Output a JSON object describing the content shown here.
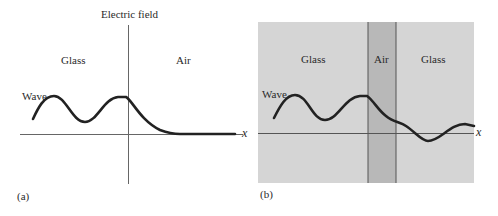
{
  "panel_a": {
    "caption": "(a)",
    "axis_label_y": "Electric field",
    "axis_label_x": "x",
    "region_left": "Glass",
    "region_right": "Air",
    "wave_label": "Wave"
  },
  "panel_b": {
    "caption": "(b)",
    "axis_label_x": "x",
    "region_left": "Glass",
    "region_middle": "Air",
    "region_right": "Glass",
    "wave_label": "Wave"
  },
  "colors": {
    "glass": "#d4d4d4",
    "air": "#b9b9b9",
    "line": "#222222",
    "axis": "#555555"
  }
}
